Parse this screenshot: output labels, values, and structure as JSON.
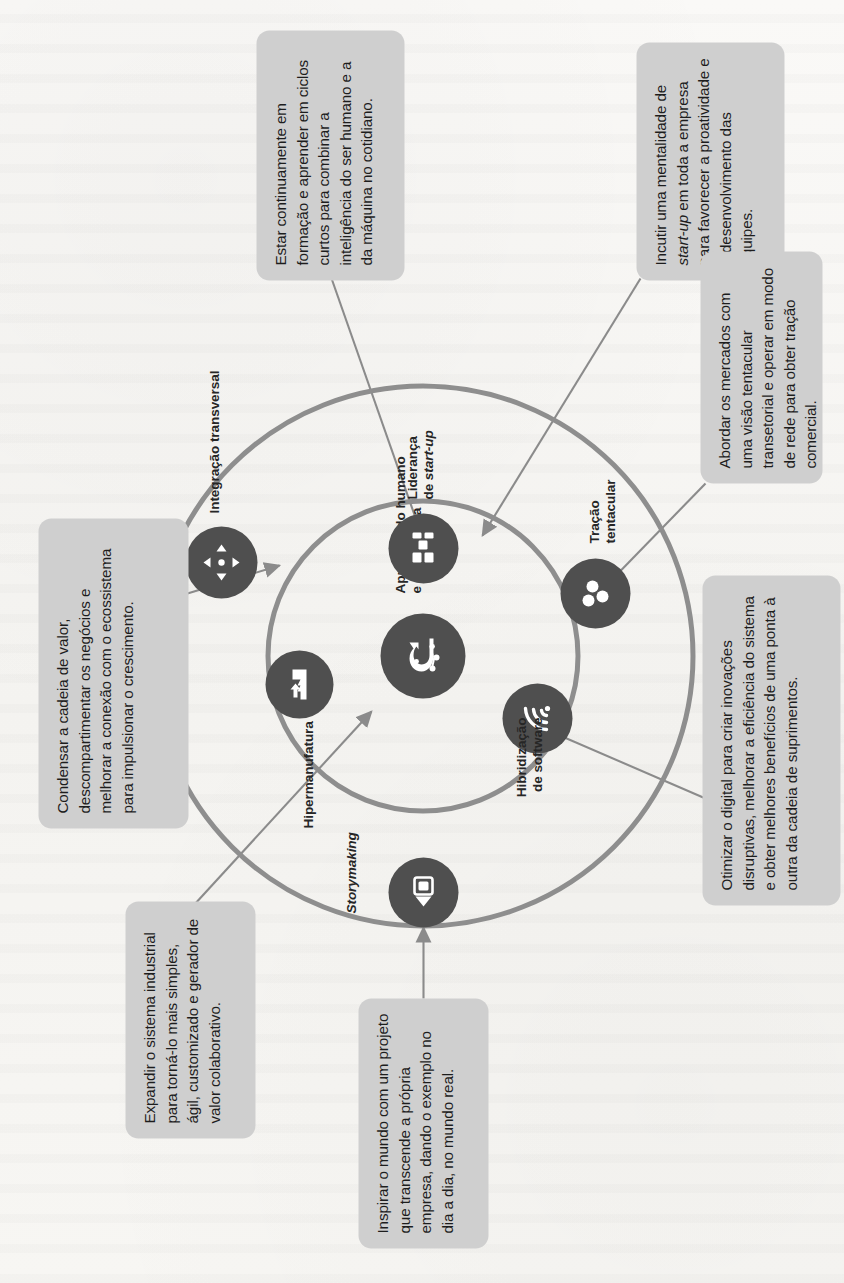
{
  "figure": {
    "title_hidden": "",
    "center": {
      "label": "Aprendizado humano\ne de máquina",
      "icon": "ai-brain-circuit-icon"
    },
    "nodes": [
      {
        "id": "storymaking",
        "label": "Storymaking",
        "italic": true,
        "icon": "projector-screen-icon"
      },
      {
        "id": "hipermanufatura",
        "label": "Hipermanufatura",
        "italic": false,
        "icon": "factory-arrow-icon"
      },
      {
        "id": "integracao",
        "label": "Integração transversal",
        "italic": false,
        "icon": "four-arrows-expand-icon"
      },
      {
        "id": "lideranca",
        "label": "Liderança\nde start-up",
        "italic": false,
        "icon": "org-blocks-icon"
      },
      {
        "id": "tracao",
        "label": "Tração\ntentacular",
        "italic": false,
        "icon": "three-nodes-icon"
      },
      {
        "id": "hibridizacao",
        "label": "Hibridização\nde software",
        "italic": false,
        "icon": "wifi-signal-icon"
      }
    ],
    "callouts": [
      {
        "id": "callout-storymaking",
        "text": "Inspirar o mundo com um projeto que transcende a própria empresa, dando o exemplo no dia a dia, no mundo real."
      },
      {
        "id": "callout-hipermanufatura",
        "text": "Expandir o sistema industrial para torná-lo mais simples, ágil, customizado e gerador de valor colaborativo."
      },
      {
        "id": "callout-integracao",
        "text": "Condensar a cadeia de valor, descompartimentar os negócios e melhorar a conexão com o ecossistema para impulsionar o crescimento."
      },
      {
        "id": "callout-aprendizado",
        "text": "Estar continuamente em formação e aprender em ciclos curtos para combinar a inteligência do ser humano e a da máquina no cotidiano."
      },
      {
        "id": "callout-lideranca",
        "text": "Incutir uma mentalidade de start-up em toda a empresa para favorecer a proatividade e o desenvolvimento das equipes."
      },
      {
        "id": "callout-tracao",
        "text": "Abordar os mercados com uma visão tentacular transetorial e operar em modo de rede para obter tração comercial."
      },
      {
        "id": "callout-hibridizacao",
        "text": "Otimizar o digital para criar inovações disruptivas, melhorar a eficiência do sistema e obter melhores benefícios de uma ponta à outra da cadeia de suprimentos."
      }
    ],
    "colors": {
      "box_fill": "#cfcfcf",
      "node_fill": "#4f4f4f",
      "ring_stroke": "#8e8e8e",
      "leader_stroke": "#8b8b8b",
      "text": "#1d1d1d",
      "page_bg": "#f7f6f4"
    }
  }
}
